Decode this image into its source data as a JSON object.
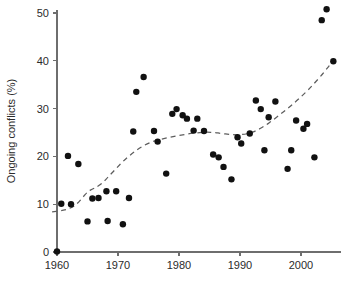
{
  "chart_data": {
    "type": "scatter",
    "title": "",
    "xlabel": "",
    "ylabel": "Ongoing conflicts (%)",
    "xlim": [
      1958.5,
      2006.5
    ],
    "ylim": [
      -1.5,
      53
    ],
    "grid": false,
    "legend": null,
    "xticks": [
      1960,
      1970,
      1980,
      1990,
      2000
    ],
    "xticklabels": [
      "1960",
      "1970",
      "1980",
      "1990",
      "2000"
    ],
    "yticks": [
      0,
      10,
      20,
      30,
      40,
      50
    ],
    "yticklabels": [
      "0",
      "10",
      "20",
      "30",
      "40",
      "50"
    ],
    "series": [
      {
        "name": "Ongoing conflicts",
        "marker": "filled-circle",
        "color": "#111111",
        "points": [
          [
            1960.0,
            0.1
          ],
          [
            1960.7,
            10.1
          ],
          [
            1961.8,
            20.1
          ],
          [
            1962.3,
            10.0
          ],
          [
            1963.5,
            18.4
          ],
          [
            1965.0,
            6.4
          ],
          [
            1965.8,
            11.2
          ],
          [
            1966.8,
            11.3
          ],
          [
            1968.1,
            12.7
          ],
          [
            1968.3,
            6.5
          ],
          [
            1969.7,
            12.7
          ],
          [
            1970.8,
            5.8
          ],
          [
            1971.8,
            11.3
          ],
          [
            1972.5,
            25.2
          ],
          [
            1973.0,
            33.5
          ],
          [
            1974.2,
            36.6
          ],
          [
            1975.9,
            25.3
          ],
          [
            1976.5,
            23.1
          ],
          [
            1977.9,
            16.4
          ],
          [
            1978.9,
            28.9
          ],
          [
            1979.6,
            29.9
          ],
          [
            1980.6,
            28.6
          ],
          [
            1981.3,
            27.9
          ],
          [
            1982.4,
            25.4
          ],
          [
            1983.0,
            27.9
          ],
          [
            1984.1,
            25.3
          ],
          [
            1985.6,
            20.4
          ],
          [
            1986.5,
            19.8
          ],
          [
            1987.3,
            17.8
          ],
          [
            1988.6,
            15.2
          ],
          [
            1989.6,
            24.0
          ],
          [
            1990.2,
            22.7
          ],
          [
            1991.6,
            24.8
          ],
          [
            1992.6,
            31.7
          ],
          [
            1993.4,
            29.9
          ],
          [
            1994.0,
            21.3
          ],
          [
            1994.7,
            28.2
          ],
          [
            1995.8,
            31.5
          ],
          [
            1997.8,
            17.4
          ],
          [
            1998.4,
            21.3
          ],
          [
            1999.2,
            27.5
          ],
          [
            2000.4,
            25.8
          ],
          [
            2001.0,
            26.8
          ],
          [
            2002.2,
            19.8
          ],
          [
            2003.4,
            48.5
          ],
          [
            2004.2,
            50.8
          ],
          [
            2005.3,
            39.9
          ]
        ]
      }
    ],
    "trend": {
      "name": "smoothed trend",
      "style": "dashed",
      "color": "#5d5d5d",
      "points": [
        [
          1959.2,
          8.4
        ],
        [
          1960.5,
          8.6
        ],
        [
          1961.6,
          8.9
        ],
        [
          1962.6,
          9.4
        ],
        [
          1963.4,
          10.2
        ],
        [
          1964.2,
          11.4
        ],
        [
          1965.0,
          12.6
        ],
        [
          1965.8,
          13.2
        ],
        [
          1966.6,
          13.6
        ],
        [
          1967.6,
          14.6
        ],
        [
          1968.6,
          16.0
        ],
        [
          1969.8,
          17.6
        ],
        [
          1971.0,
          19.2
        ],
        [
          1972.3,
          20.6
        ],
        [
          1973.6,
          21.8
        ],
        [
          1975.0,
          22.8
        ],
        [
          1976.4,
          23.4
        ],
        [
          1977.8,
          23.8
        ],
        [
          1979.2,
          24.2
        ],
        [
          1980.6,
          24.5
        ],
        [
          1982.0,
          24.8
        ],
        [
          1983.4,
          25.0
        ],
        [
          1984.6,
          25.1
        ],
        [
          1985.8,
          25.0
        ],
        [
          1987.0,
          24.8
        ],
        [
          1988.2,
          24.6
        ],
        [
          1989.4,
          24.5
        ],
        [
          1990.6,
          24.6
        ],
        [
          1991.8,
          24.9
        ],
        [
          1993.0,
          25.6
        ],
        [
          1994.2,
          26.5
        ],
        [
          1995.4,
          27.6
        ],
        [
          1996.6,
          28.8
        ],
        [
          1997.8,
          30.0
        ],
        [
          1999.0,
          31.3
        ],
        [
          2000.2,
          32.7
        ],
        [
          2001.4,
          34.2
        ],
        [
          2002.4,
          35.6
        ],
        [
          2003.4,
          37.0
        ],
        [
          2004.2,
          38.3
        ],
        [
          2004.9,
          39.4
        ],
        [
          2005.4,
          40.0
        ]
      ]
    }
  }
}
